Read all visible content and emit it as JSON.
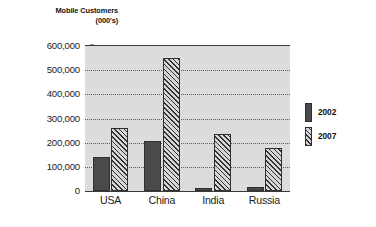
{
  "chart_data": {
    "type": "bar",
    "title": "Mobile Customers (000's)",
    "title_lines": [
      "Mobile Customers",
      "(000's)"
    ],
    "xlabel": "",
    "ylabel": "",
    "categories": [
      "USA",
      "China",
      "India",
      "Russia"
    ],
    "series": [
      {
        "name": "2002",
        "values": [
          141000,
          206000,
          13000,
          18000
        ],
        "color": "#4a4a4a",
        "fill": "solid"
      },
      {
        "name": "2007",
        "values": [
          260000,
          550000,
          234000,
          180000
        ],
        "color": "#333333",
        "fill": "diagonal-hatch"
      }
    ],
    "ylim": [
      0,
      600000
    ],
    "ytick_values": [
      0,
      100000,
      200000,
      300000,
      400000,
      500000,
      600000
    ],
    "ytick_labels": [
      "0",
      "100,000",
      "200,000",
      "300,000",
      "400,000",
      "500,000",
      "600,000"
    ],
    "grid": "horizontal-dotted",
    "legend_position": "right",
    "plot_background": "#dcdcdc"
  },
  "legend": {
    "items": [
      {
        "label": "2002"
      },
      {
        "label": "2007"
      }
    ]
  }
}
